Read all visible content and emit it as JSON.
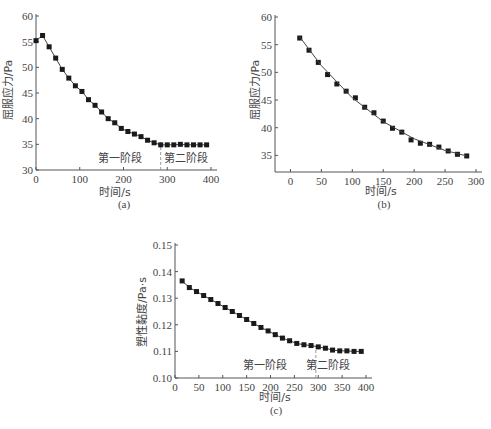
{
  "chart_data": [
    {
      "id": "a",
      "caption": "(a)",
      "type": "line",
      "xlabel": "时间/s",
      "ylabel": "屈服应力/Pa",
      "xlim": [
        0,
        400
      ],
      "ylim": [
        30,
        60
      ],
      "xticks": [
        0,
        100,
        200,
        300,
        400
      ],
      "yticks": [
        30,
        35,
        40,
        45,
        50,
        55,
        60
      ],
      "annotations": [
        {
          "text": "第一阶段",
          "x": 200,
          "y": 32.5
        },
        {
          "text": "第二阶段",
          "x": 340,
          "y": 32.5
        },
        {
          "type": "vline-dashed",
          "x": 285
        }
      ],
      "series": [
        {
          "name": "屈服应力",
          "marker": "square",
          "x": [
            0,
            15,
            30,
            45,
            60,
            75,
            90,
            105,
            120,
            135,
            150,
            165,
            180,
            195,
            210,
            225,
            240,
            255,
            270,
            285,
            300,
            315,
            330,
            345,
            360,
            375,
            390
          ],
          "y": [
            55.2,
            56.2,
            54.0,
            51.8,
            49.6,
            47.9,
            46.4,
            45.3,
            43.7,
            42.6,
            41.3,
            40.0,
            39.2,
            38.1,
            37.5,
            37.0,
            36.5,
            35.8,
            35.3,
            34.9,
            34.9,
            34.9,
            35.0,
            34.9,
            34.9,
            34.9,
            34.9
          ]
        }
      ]
    },
    {
      "id": "b",
      "caption": "(b)",
      "type": "scatter",
      "xlabel": "时间/s",
      "ylabel": "屈服应力/Pa",
      "xlim": [
        -25,
        300
      ],
      "ylim": [
        32,
        60
      ],
      "xticks": [
        0,
        50,
        100,
        150,
        200,
        250,
        300
      ],
      "yticks": [
        35,
        40,
        45,
        50,
        55,
        60
      ],
      "series": [
        {
          "name": "屈服应力",
          "marker": "square",
          "x": [
            15,
            30,
            45,
            60,
            75,
            90,
            105,
            120,
            135,
            150,
            165,
            180,
            195,
            210,
            225,
            240,
            255,
            270,
            285
          ],
          "y": [
            56.2,
            54.0,
            51.8,
            49.6,
            47.9,
            46.6,
            45.4,
            43.7,
            42.7,
            41.2,
            39.9,
            39.2,
            37.8,
            37.2,
            37.0,
            36.5,
            35.8,
            35.2,
            34.9
          ]
        },
        {
          "name": "拟合曲线",
          "type": "line",
          "x": [
            15,
            50,
            100,
            150,
            200,
            250,
            285
          ],
          "y": [
            56.4,
            51.2,
            45.4,
            41.1,
            38.0,
            35.9,
            34.9
          ]
        }
      ]
    },
    {
      "id": "c",
      "caption": "(c)",
      "type": "line",
      "xlabel": "时间/s",
      "ylabel": "塑性黏度/Pa·s",
      "xlim": [
        0,
        400
      ],
      "ylim": [
        0.1,
        0.15
      ],
      "xticks": [
        0,
        50,
        100,
        150,
        200,
        250,
        300,
        350,
        400
      ],
      "yticks": [
        0.1,
        0.11,
        0.12,
        0.13,
        0.14,
        0.15
      ],
      "annotations": [
        {
          "text": "第一阶段",
          "x": 220,
          "y": 0.105
        },
        {
          "text": "第二阶段",
          "x": 345,
          "y": 0.105
        },
        {
          "type": "vline-dashed",
          "x": 295
        }
      ],
      "series": [
        {
          "name": "塑性黏度",
          "marker": "square",
          "x": [
            15,
            30,
            45,
            60,
            75,
            90,
            105,
            120,
            135,
            150,
            165,
            180,
            195,
            210,
            225,
            240,
            255,
            270,
            285,
            300,
            315,
            330,
            345,
            360,
            375,
            390
          ],
          "y": [
            0.1365,
            0.134,
            0.1325,
            0.131,
            0.1295,
            0.128,
            0.1265,
            0.125,
            0.1235,
            0.122,
            0.1205,
            0.119,
            0.1177,
            0.1163,
            0.115,
            0.114,
            0.113,
            0.1125,
            0.1122,
            0.1117,
            0.1112,
            0.1105,
            0.1102,
            0.1102,
            0.11,
            0.11
          ]
        }
      ]
    }
  ],
  "labels": {
    "a": {
      "caption": "(a)",
      "xlabel": "时间/s",
      "ylabel": "屈服应力/Pa",
      "stage1": "第一阶段",
      "stage2": "第二阶段"
    },
    "b": {
      "caption": "(b)",
      "xlabel": "时间/s",
      "ylabel": "屈服应力/Pa"
    },
    "c": {
      "caption": "(c)",
      "xlabel": "时间/s",
      "ylabel": "塑性黏度/Pa·s",
      "stage1": "第一阶段",
      "stage2": "第二阶段"
    }
  }
}
